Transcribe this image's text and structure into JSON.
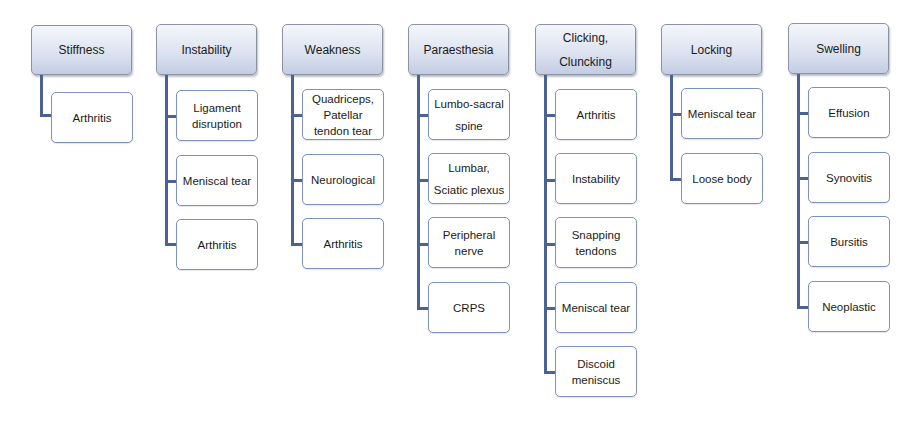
{
  "diagram": {
    "colors": {
      "header_gradient_top": "#f4f6fb",
      "header_gradient_bottom": "#c3cde3",
      "header_border": "#8d92a0",
      "child_border": "#7d90bf",
      "connector": "#4a6394",
      "background": "#ffffff"
    },
    "columns": [
      {
        "header": "Stiffness",
        "children": [
          "Arthritis"
        ]
      },
      {
        "header": "Instability",
        "children": [
          "Ligament disruption",
          "Meniscal tear",
          "Arthritis"
        ]
      },
      {
        "header": "Weakness",
        "children": [
          "Quadriceps, Patellar tendon tear",
          "Neurological",
          "Arthritis"
        ]
      },
      {
        "header": "Paraesthesia",
        "children": [
          "Lumbo-sacral spine",
          "Lumbar, Sciatic plexus",
          "Peripheral nerve",
          "CRPS"
        ]
      },
      {
        "header": "Clicking, Cluncking",
        "children": [
          "Arthritis",
          "Instability",
          "Snapping tendons",
          "Meniscal tear",
          "Discoid meniscus"
        ]
      },
      {
        "header": "Locking",
        "children": [
          "Meniscal tear",
          "Loose body"
        ]
      },
      {
        "header": "Swelling",
        "children": [
          "Effusion",
          "Synovitis",
          "Bursitis",
          "Neoplastic"
        ]
      }
    ]
  }
}
